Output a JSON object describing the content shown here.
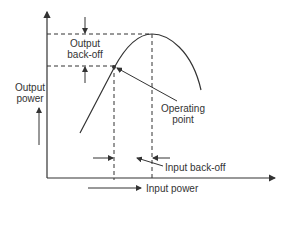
{
  "diagram": {
    "type": "amplifier-transfer-curve",
    "labels": {
      "output_backoff_line1": "Output",
      "output_backoff_line2": "back-off",
      "output_power_line1": "Output",
      "output_power_line2": "power",
      "operating_point_line1": "Operating",
      "operating_point_line2": "point",
      "input_backoff": "Input back-off",
      "input_power": "Input power"
    },
    "colors": {
      "stroke": "#333333",
      "background": "#ffffff"
    }
  }
}
